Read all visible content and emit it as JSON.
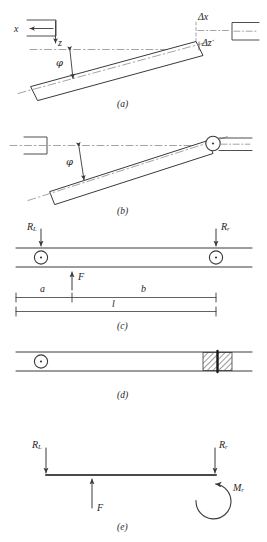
{
  "figure": {
    "stroke_color": "#3a3a3a",
    "dash_color": "#8a8a8a",
    "panels": [
      {
        "id": "a",
        "label": "(a)",
        "description": "Tilted shaft with parallel offset showing axis directions and angular misalignment",
        "annotations": [
          {
            "name": "x-axis-label",
            "text": "x"
          },
          {
            "name": "z-axis-label",
            "text": "z"
          },
          {
            "name": "delta-x-label",
            "text": "Δx"
          },
          {
            "name": "delta-z-label",
            "text": "Δz"
          },
          {
            "name": "phi-angle-label",
            "text": "φ"
          }
        ]
      },
      {
        "id": "b",
        "label": "(b)",
        "description": "Tilted shaft pinned at right bearing showing angular misalignment only",
        "annotations": [
          {
            "name": "phi-angle-label",
            "text": "φ"
          }
        ]
      },
      {
        "id": "c",
        "label": "(c)",
        "description": "Straight shaft on two pin supports with applied force and span dimensions",
        "annotations": [
          {
            "name": "left-reaction-label",
            "text": "R",
            "subscript": "L"
          },
          {
            "name": "right-reaction-label",
            "text": "R",
            "subscript": "r"
          },
          {
            "name": "force-label",
            "text": "F"
          },
          {
            "name": "dimension-a-label",
            "text": "a"
          },
          {
            "name": "dimension-b-label",
            "text": "b"
          },
          {
            "name": "dimension-l-label",
            "text": "l"
          }
        ]
      },
      {
        "id": "d",
        "label": "(d)",
        "description": "Shaft pinned at left and rigidly clamped (hatched) at right",
        "annotations": []
      },
      {
        "id": "e",
        "label": "(e)",
        "description": "Free body diagram with reactions, applied force and end moment",
        "annotations": [
          {
            "name": "left-reaction-label",
            "text": "R",
            "subscript": "L"
          },
          {
            "name": "right-reaction-label",
            "text": "R",
            "subscript": "r"
          },
          {
            "name": "force-label",
            "text": "F"
          },
          {
            "name": "moment-label",
            "text": "M",
            "subscript": "r"
          }
        ]
      }
    ]
  },
  "labels": {
    "panel_a": "(a)",
    "panel_b": "(b)",
    "panel_c": "(c)",
    "panel_d": "(d)",
    "panel_e": "(e)",
    "x_axis": "x",
    "z_axis": "z",
    "delta_x": "Δx",
    "delta_z": "Δz",
    "phi_a": "φ",
    "phi_b": "φ",
    "R_letter": "R",
    "R_L_sub": "L",
    "R_r_sub": "r",
    "F": "F",
    "dim_a": "a",
    "dim_b": "b",
    "dim_l": "l",
    "M_letter": "M",
    "M_r_sub": "r"
  }
}
